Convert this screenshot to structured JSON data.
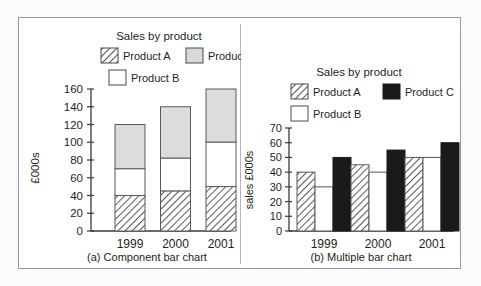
{
  "figure": {
    "background": "#fbfbfb",
    "frame_color": "#9b93a8",
    "ink": "#231f20"
  },
  "charts": [
    {
      "id": "component-bar-chart",
      "caption": "(a) Component bar chart",
      "title": "Sales by product",
      "ylabel": "£000s",
      "legend": [
        {
          "label": "Product A",
          "fill": "hatch",
          "color": "#ffffff"
        },
        {
          "label": "Product C",
          "fill": "solid",
          "color": "#d9d9d9"
        },
        {
          "label": "Product B",
          "fill": "solid",
          "color": "#ffffff"
        }
      ],
      "yticks": [
        0,
        20,
        40,
        60,
        80,
        100,
        120,
        140,
        160
      ],
      "xticks": [
        "1999",
        "2000",
        "2001"
      ]
    },
    {
      "id": "multiple-bar-chart",
      "caption": "(b) Multiple bar chart",
      "title": "Sales by product",
      "ylabel": "sales £000s",
      "legend": [
        {
          "label": "Product A",
          "fill": "hatch",
          "color": "#ffffff"
        },
        {
          "label": "Product C",
          "fill": "solid",
          "color": "#1a1a1a"
        },
        {
          "label": "Product B",
          "fill": "solid",
          "color": "#ffffff"
        }
      ],
      "yticks": [
        0,
        10,
        20,
        30,
        40,
        50,
        60,
        70
      ],
      "xticks": [
        "1999",
        "2000",
        "2001"
      ]
    }
  ],
  "chart_data": [
    {
      "type": "bar",
      "subtype": "stacked",
      "id": "component-bar-chart",
      "title": "Sales by product",
      "caption": "(a) Component bar chart",
      "xlabel": "",
      "ylabel": "£000s",
      "ylim": [
        0,
        160
      ],
      "ytick_step": 20,
      "grid": false,
      "legend_position": "top",
      "categories": [
        "1999",
        "2000",
        "2001"
      ],
      "series": [
        {
          "name": "Product A",
          "values": [
            40,
            45,
            50
          ],
          "fill": "hatch"
        },
        {
          "name": "Product B",
          "values": [
            30,
            37,
            50
          ],
          "fill": "white"
        },
        {
          "name": "Product C",
          "values": [
            50,
            58,
            60
          ],
          "fill": "lightgrey"
        }
      ],
      "cumulative_tops": [
        {
          "category": "1999",
          "A": 40,
          "A_plus_B": 70,
          "total": 120
        },
        {
          "category": "2000",
          "A": 45,
          "A_plus_B": 82,
          "total": 140
        },
        {
          "category": "2001",
          "A": 50,
          "A_plus_B": 100,
          "total": 160
        }
      ]
    },
    {
      "type": "bar",
      "subtype": "grouped",
      "id": "multiple-bar-chart",
      "title": "Sales by product",
      "caption": "(b) Multiple bar chart",
      "xlabel": "",
      "ylabel": "sales £000s",
      "ylim": [
        0,
        70
      ],
      "ytick_step": 10,
      "grid": false,
      "legend_position": "top",
      "categories": [
        "1999",
        "2000",
        "2001"
      ],
      "series": [
        {
          "name": "Product A",
          "values": [
            40,
            45,
            50
          ],
          "fill": "hatch"
        },
        {
          "name": "Product B",
          "values": [
            30,
            40,
            50
          ],
          "fill": "white"
        },
        {
          "name": "Product C",
          "values": [
            50,
            55,
            60
          ],
          "fill": "black"
        }
      ]
    }
  ]
}
